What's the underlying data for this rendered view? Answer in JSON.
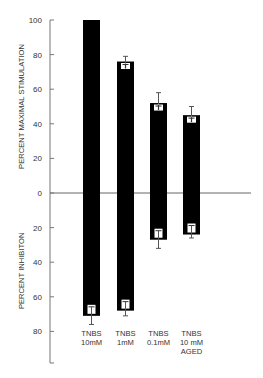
{
  "chart_data": {
    "type": "bar",
    "title": "",
    "categories": [
      "TNBS 10mM",
      "TNBS 1mM",
      "TNBS 0.1mM",
      "TNBS 10 mM AGED"
    ],
    "category_lines": [
      [
        "TNBS",
        "10mM"
      ],
      [
        "TNBS",
        "1mM"
      ],
      [
        "TNBS",
        "0.1mM"
      ],
      [
        "TNBS",
        "10 mM",
        "AGED"
      ]
    ],
    "series": [
      {
        "name": "Percent maximal stimulation",
        "direction": "up",
        "values": [
          100,
          76,
          52,
          45
        ],
        "error": [
          0,
          3,
          6,
          5
        ]
      },
      {
        "name": "Percent inhibition",
        "direction": "down",
        "values": [
          71,
          68,
          27,
          24
        ],
        "error": [
          5,
          3,
          5,
          2
        ]
      }
    ],
    "ylabel_top": "PERCENT MAXIMAL STIMULATION",
    "ylabel_bottom": "PERCENT INHIBITON",
    "yticks_top": [
      100,
      80,
      60,
      40,
      20
    ],
    "yticks_zero": 0,
    "yticks_bottom": [
      20,
      40,
      60,
      80
    ],
    "ylim_top": [
      0,
      100
    ],
    "ylim_bottom": [
      0,
      98
    ],
    "grid": false,
    "legend": "none",
    "bar_color": "#000000"
  }
}
